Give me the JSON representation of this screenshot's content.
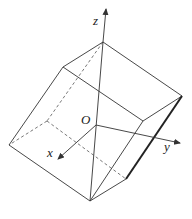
{
  "diagram": {
    "type": "3d-solid-with-axes",
    "labels": {
      "z": "z",
      "y": "y",
      "x": "x",
      "origin": "O"
    },
    "vertices": {
      "top": [
        103,
        42
      ],
      "top_left": [
        63,
        67
      ],
      "right": [
        182,
        96
      ],
      "inner_right": [
        143,
        121
      ],
      "left": [
        9,
        145
      ],
      "hidden_left": [
        47,
        121
      ],
      "bottom_right": [
        126,
        179
      ],
      "bottom": [
        90,
        201
      ]
    },
    "axes": {
      "origin": [
        96,
        125
      ],
      "z_tip": [
        106,
        8
      ],
      "y_tip": [
        181,
        143
      ],
      "x_tip": [
        57,
        160
      ]
    },
    "colors": {
      "line": "#333333",
      "background": "#ffffff"
    }
  }
}
